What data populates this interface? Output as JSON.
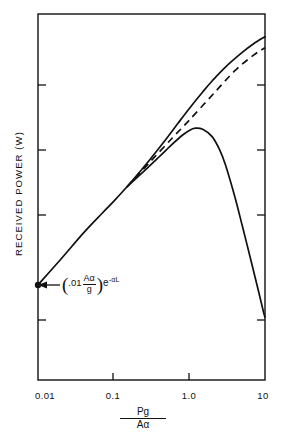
{
  "chart_data": {
    "type": "line",
    "title": "",
    "xlabel": "Pg / Aα",
    "xlabel_numerator": "Pg",
    "xlabel_denominator": "Aα",
    "ylabel": "RECEIVED POWER (W)",
    "xscale": "log",
    "yscale": "log",
    "xlim": [
      0.01,
      10
    ],
    "xticks": [
      0.01,
      0.1,
      1.0,
      10
    ],
    "xtick_labels": [
      "0.01",
      "0.1",
      "1.0",
      "10"
    ],
    "yticks_unlabeled": 4,
    "grid": false,
    "legend": "none",
    "annotations": [
      {
        "name": "origin-point-label",
        "text": "(.01 Aα/g) e^-αL",
        "lead": ".01",
        "frac_numerator": "Aα",
        "frac_denominator": "g",
        "exp_base": "e",
        "exp_superscript": "-αL",
        "points_to": {
          "x": 0.01,
          "y_pixel_fraction": 0.74
        },
        "marker": "filled-dot"
      }
    ],
    "series": [
      {
        "name": "upper-solid-curve",
        "style": "solid",
        "color": "#111111",
        "points": [
          [
            0.01,
            0.74
          ],
          [
            0.02,
            0.67
          ],
          [
            0.04,
            0.598
          ],
          [
            0.07,
            0.545
          ],
          [
            0.1,
            0.512
          ],
          [
            0.15,
            0.472
          ],
          [
            0.2,
            0.442
          ],
          [
            0.3,
            0.398
          ],
          [
            0.5,
            0.34
          ],
          [
            0.7,
            0.3
          ],
          [
            1.0,
            0.258
          ],
          [
            1.5,
            0.213
          ],
          [
            2.0,
            0.183
          ],
          [
            3.0,
            0.145
          ],
          [
            5.0,
            0.105
          ],
          [
            7.0,
            0.082
          ],
          [
            10.0,
            0.062
          ]
        ]
      },
      {
        "name": "dashed-asymptote-line",
        "style": "dashed",
        "color": "#111111",
        "points": [
          [
            0.15,
            0.472
          ],
          [
            0.3,
            0.405
          ],
          [
            0.6,
            0.338
          ],
          [
            1.0,
            0.29
          ],
          [
            2.0,
            0.222
          ],
          [
            4.0,
            0.155
          ],
          [
            7.0,
            0.113
          ],
          [
            10.0,
            0.092
          ]
        ]
      },
      {
        "name": "lower-solid-peaked-curve",
        "style": "solid",
        "color": "#111111",
        "points": [
          [
            0.15,
            0.472
          ],
          [
            0.25,
            0.43
          ],
          [
            0.4,
            0.39
          ],
          [
            0.6,
            0.355
          ],
          [
            0.8,
            0.332
          ],
          [
            1.0,
            0.318
          ],
          [
            1.2,
            0.312
          ],
          [
            1.5,
            0.315
          ],
          [
            2.0,
            0.335
          ],
          [
            2.5,
            0.37
          ],
          [
            3.0,
            0.412
          ],
          [
            4.0,
            0.5
          ],
          [
            5.0,
            0.578
          ],
          [
            6.5,
            0.672
          ],
          [
            8.0,
            0.748
          ],
          [
            9.5,
            0.812
          ],
          [
            10.0,
            0.828
          ]
        ]
      }
    ]
  },
  "figure": {
    "background_color": "#ffffff",
    "axis_color": "#111111",
    "curve_color": "#111111"
  }
}
